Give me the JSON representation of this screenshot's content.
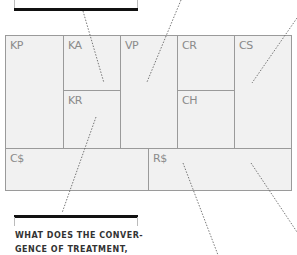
{
  "canvas": {
    "blocks": [
      {
        "id": "kp",
        "label": "KP",
        "x": 5,
        "y": 35,
        "w": 58,
        "h": 113
      },
      {
        "id": "ka",
        "label": "KA",
        "x": 63,
        "y": 35,
        "w": 57,
        "h": 55
      },
      {
        "id": "kr",
        "label": "KR",
        "x": 63,
        "y": 90,
        "w": 57,
        "h": 58
      },
      {
        "id": "vp",
        "label": "VP",
        "x": 120,
        "y": 35,
        "w": 57,
        "h": 113
      },
      {
        "id": "cr",
        "label": "CR",
        "x": 177,
        "y": 35,
        "w": 57,
        "h": 55
      },
      {
        "id": "ch",
        "label": "CH",
        "x": 177,
        "y": 90,
        "w": 57,
        "h": 58
      },
      {
        "id": "cs",
        "label": "CS",
        "x": 234,
        "y": 35,
        "w": 57,
        "h": 113
      },
      {
        "id": "cost",
        "label": "C$",
        "x": 5,
        "y": 148,
        "w": 143,
        "h": 42
      },
      {
        "id": "rev",
        "label": "R$",
        "x": 148,
        "y": 148,
        "w": 143,
        "h": 42
      }
    ]
  },
  "callouts": {
    "bottom": {
      "text_line1": "WHAT DOES THE CONVER-",
      "text_line2": "GENCE OF TREATMENT,"
    }
  }
}
